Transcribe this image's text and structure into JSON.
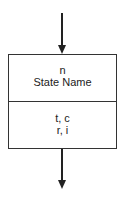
{
  "state_box": {
    "number_label": "n",
    "state_name": "State Name",
    "line1": "t, c",
    "line2": "r, i"
  },
  "arrows": {
    "incoming": "down-arrow",
    "outgoing": "down-arrow"
  }
}
